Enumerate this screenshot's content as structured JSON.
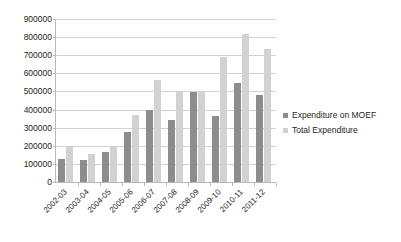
{
  "chart_data": {
    "type": "bar",
    "title": "",
    "xlabel": "",
    "ylabel": "",
    "ylim": [
      0,
      900000
    ],
    "ytick_step": 100000,
    "yticks": [
      "0",
      "100000",
      "200000",
      "300000",
      "400000",
      "500000",
      "600000",
      "700000",
      "800000",
      "900000"
    ],
    "grid": true,
    "legend_position": "right",
    "categories": [
      "2002-03",
      "2003-04",
      "2004-05",
      "2005-06",
      "2006-07",
      "2007-08",
      "2008-09",
      "2009-10",
      "2010-11",
      "2011-12"
    ],
    "series": [
      {
        "name": "Expenditure on MOEF",
        "color": "#8d8d8d",
        "values": [
          125000,
          120000,
          165000,
          275000,
          395000,
          345000,
          495000,
          365000,
          545000,
          480000
        ]
      },
      {
        "name": "Total Expenditure",
        "color": "#d2d2d2",
        "values": [
          200000,
          152000,
          195000,
          370000,
          565000,
          495000,
          495000,
          690000,
          820000,
          735000
        ]
      }
    ]
  }
}
